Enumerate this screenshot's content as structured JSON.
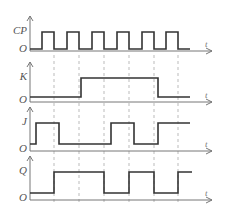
{
  "diagram": {
    "time_label": "t",
    "origin_label": "O",
    "clock_edges_x": [
      54,
      79,
      104,
      129,
      154,
      178
    ],
    "colors": {
      "wave": "#333333",
      "axis": "#777777",
      "dash": "#aaaaaa",
      "label": "#555555"
    },
    "signals": [
      {
        "name": "CP",
        "axis_y": 51,
        "high_y": 32,
        "low_y": 49,
        "points": [
          [
            30,
            49
          ],
          [
            42,
            49
          ],
          [
            42,
            32
          ],
          [
            54,
            32
          ],
          [
            54,
            49
          ],
          [
            67,
            49
          ],
          [
            67,
            32
          ],
          [
            79,
            32
          ],
          [
            79,
            49
          ],
          [
            92,
            49
          ],
          [
            92,
            32
          ],
          [
            104,
            32
          ],
          [
            104,
            49
          ],
          [
            117,
            49
          ],
          [
            117,
            32
          ],
          [
            129,
            32
          ],
          [
            129,
            49
          ],
          [
            142,
            49
          ],
          [
            142,
            32
          ],
          [
            154,
            32
          ],
          [
            154,
            49
          ],
          [
            166,
            49
          ],
          [
            166,
            32
          ],
          [
            178,
            32
          ],
          [
            178,
            49
          ],
          [
            190,
            49
          ]
        ]
      },
      {
        "name": "K",
        "axis_y": 102,
        "high_y": 78,
        "low_y": 97,
        "points": [
          [
            30,
            97
          ],
          [
            81,
            97
          ],
          [
            81,
            78
          ],
          [
            158,
            78
          ],
          [
            158,
            97
          ],
          [
            190,
            97
          ]
        ]
      },
      {
        "name": "J",
        "axis_y": 151,
        "high_y": 123,
        "low_y": 144,
        "points": [
          [
            30,
            144
          ],
          [
            36,
            144
          ],
          [
            36,
            123
          ],
          [
            59,
            123
          ],
          [
            59,
            144
          ],
          [
            111,
            144
          ],
          [
            111,
            123
          ],
          [
            134,
            123
          ],
          [
            134,
            144
          ],
          [
            158,
            144
          ],
          [
            158,
            123
          ],
          [
            190,
            123
          ]
        ]
      },
      {
        "name": "Q",
        "axis_y": 200,
        "high_y": 172,
        "low_y": 193,
        "points": [
          [
            30,
            193
          ],
          [
            54,
            193
          ],
          [
            54,
            172
          ],
          [
            104,
            172
          ],
          [
            104,
            193
          ],
          [
            129,
            193
          ],
          [
            129,
            172
          ],
          [
            154,
            172
          ],
          [
            154,
            193
          ],
          [
            178,
            193
          ],
          [
            178,
            172
          ],
          [
            192,
            172
          ]
        ]
      }
    ]
  }
}
